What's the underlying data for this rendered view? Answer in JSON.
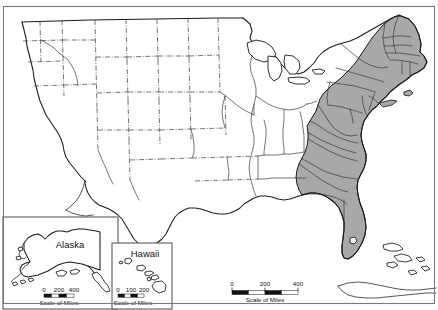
{
  "map": {
    "title": "United States map with shaded eastern states",
    "background_color": "#ffffff",
    "line_color": "#1b1b1b",
    "frame_color": "#7a7a7a",
    "shaded_region": {
      "fill_color": "#a8a8a8",
      "outline_color": "#1b1b1b",
      "description": "Eastern seaboard states shaded gray"
    },
    "scale": {
      "ticks": [
        "0",
        "200",
        "400"
      ],
      "caption": "Scale of Miles"
    }
  },
  "insets": {
    "alaska": {
      "label": "Alaska",
      "scale": {
        "ticks": [
          "0",
          "200",
          "400"
        ],
        "caption": "Scale of Miles"
      }
    },
    "hawaii": {
      "label": "Hawaii",
      "scale": {
        "ticks": [
          "0",
          "100",
          "200"
        ],
        "caption": "Scale of Miles"
      }
    }
  }
}
